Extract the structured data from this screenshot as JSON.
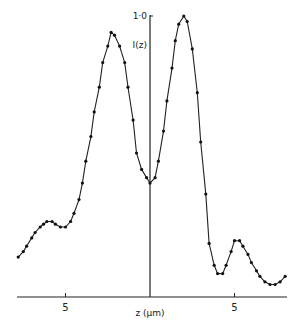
{
  "chart_data": {
    "type": "line",
    "title": "",
    "xlabel": "z (μm)",
    "ylabel": "I(z)",
    "y_max_label": "1·0",
    "x_ticks": [
      {
        "value": -5,
        "label": "5"
      },
      {
        "value": 0,
        "label": ""
      },
      {
        "value": 5,
        "label": "5"
      }
    ],
    "xlim": [
      -7.8,
      8.1
    ],
    "ylim": [
      0,
      1.0
    ],
    "grid": false,
    "legend": null,
    "series": [
      {
        "name": "I(z)",
        "marker": "dot",
        "x": [
          -7.8,
          -7.5,
          -7.3,
          -7.0,
          -6.8,
          -6.5,
          -6.3,
          -6.1,
          -5.8,
          -5.6,
          -5.3,
          -5.0,
          -4.7,
          -4.5,
          -4.2,
          -4.0,
          -3.8,
          -3.5,
          -3.3,
          -3.0,
          -2.8,
          -2.5,
          -2.3,
          -2.1,
          -1.8,
          -1.5,
          -1.3,
          -1.0,
          -0.8,
          -0.5,
          -0.2,
          0.0,
          0.3,
          0.5,
          0.8,
          1.0,
          1.3,
          1.5,
          1.7,
          2.0,
          2.2,
          2.5,
          2.8,
          3.0,
          3.3,
          3.5,
          3.8,
          4.0,
          4.3,
          4.5,
          4.8,
          5.0,
          5.3,
          5.5,
          5.8,
          6.0,
          6.3,
          6.5,
          6.8,
          7.1,
          7.4,
          7.7,
          8.0
        ],
        "y": [
          0.12,
          0.14,
          0.16,
          0.19,
          0.21,
          0.23,
          0.24,
          0.25,
          0.25,
          0.24,
          0.23,
          0.23,
          0.25,
          0.28,
          0.33,
          0.39,
          0.47,
          0.56,
          0.65,
          0.74,
          0.83,
          0.89,
          0.94,
          0.93,
          0.89,
          0.83,
          0.74,
          0.62,
          0.5,
          0.44,
          0.41,
          0.39,
          0.41,
          0.47,
          0.58,
          0.69,
          0.81,
          0.91,
          0.97,
          1.0,
          0.98,
          0.88,
          0.72,
          0.54,
          0.35,
          0.17,
          0.09,
          0.06,
          0.06,
          0.09,
          0.14,
          0.18,
          0.18,
          0.16,
          0.13,
          0.1,
          0.07,
          0.05,
          0.03,
          0.02,
          0.02,
          0.03,
          0.05
        ]
      }
    ]
  }
}
